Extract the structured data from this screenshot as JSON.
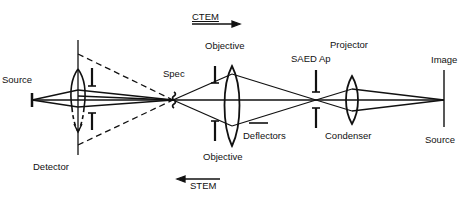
{
  "diagram": {
    "labels": {
      "ctem": "CTEM",
      "stem": "STEM",
      "source_left": "Source",
      "detector": "Detector",
      "spec": "Spec",
      "objective_top": "Objective",
      "objective_bottom": "Objective",
      "deflectors": "Deflectors",
      "saed_ap": "SAED Ap",
      "projector": "Projector",
      "condenser": "Condenser",
      "image": "Image",
      "source_right": "Source"
    },
    "colors": {
      "line": "#111111",
      "background": "#ffffff"
    }
  }
}
